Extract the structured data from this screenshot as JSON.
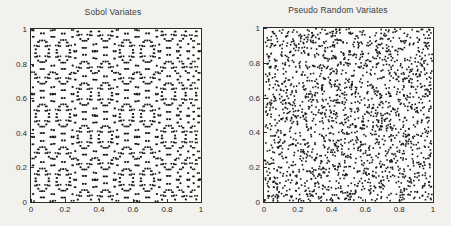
{
  "figure": {
    "background_color": "#f2f1ee",
    "axis_color": "#2b2b2b",
    "point_color": "#1a1a1a"
  },
  "chart_data": [
    {
      "type": "scatter",
      "title": "Sobol Variates",
      "xlabel": "",
      "ylabel": "",
      "xlim": [
        0,
        1
      ],
      "ylim": [
        0,
        1
      ],
      "xticks": [
        0,
        0.2,
        0.4,
        0.6,
        0.8,
        1
      ],
      "yticks": [
        0,
        0.2,
        0.4,
        0.6,
        0.8,
        1
      ],
      "xticklabels": [
        "0",
        "0.2",
        "0.4",
        "0.6",
        "0.8",
        "1"
      ],
      "yticklabels": [
        "0",
        "0.2",
        "0.4",
        "0.6",
        "0.8",
        "1"
      ],
      "grid": false,
      "legend": false,
      "marker": "point",
      "marker_size": 1.6,
      "n_points": 2048,
      "sequence": "sobol",
      "description": "Low-discrepancy quasi-random Sobol sequence filling the unit square with uniform spacing and visible moire structure"
    },
    {
      "type": "scatter",
      "title": "Pseudo Random Variates",
      "xlabel": "",
      "ylabel": "",
      "xlim": [
        0,
        1
      ],
      "ylim": [
        0,
        1
      ],
      "xticks": [
        0,
        0.2,
        0.4,
        0.6,
        0.8,
        1
      ],
      "yticks": [
        0,
        0.2,
        0.4,
        0.6,
        0.8,
        1
      ],
      "xticklabels": [
        "0",
        "0.2",
        "0.4",
        "0.6",
        "0.8",
        "1"
      ],
      "yticklabels": [
        "0",
        "0.2",
        "0.4",
        "0.6",
        "0.8",
        "1"
      ],
      "grid": false,
      "legend": false,
      "marker": "point",
      "marker_size": 1.6,
      "n_points": 2048,
      "sequence": "pseudo-random",
      "description": "Uniform pseudo-random points in the unit square showing clumps and empty voids"
    }
  ]
}
